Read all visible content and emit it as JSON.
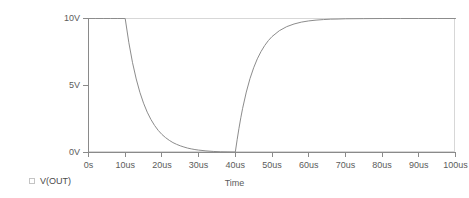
{
  "chart_data": {
    "type": "line",
    "title": "",
    "xlabel": "Time",
    "ylabel": "",
    "xlim": [
      0,
      100
    ],
    "xunit": "us",
    "ylim": [
      0,
      10
    ],
    "yunit": "V",
    "grid": false,
    "legend_position": "bottom-left",
    "x_ticks": [
      {
        "value": 0,
        "label": "0s"
      },
      {
        "value": 10,
        "label": "10us"
      },
      {
        "value": 20,
        "label": "20us"
      },
      {
        "value": 30,
        "label": "30us"
      },
      {
        "value": 40,
        "label": "40us"
      },
      {
        "value": 50,
        "label": "50us"
      },
      {
        "value": 60,
        "label": "60us"
      },
      {
        "value": 70,
        "label": "70us"
      },
      {
        "value": 80,
        "label": "80us"
      },
      {
        "value": 90,
        "label": "90us"
      },
      {
        "value": 100,
        "label": "100us"
      }
    ],
    "y_ticks": [
      {
        "value": 0,
        "label": "0V"
      },
      {
        "value": 5,
        "label": "5V"
      },
      {
        "value": 10,
        "label": "10V"
      }
    ],
    "series": [
      {
        "name": "V(OUT)",
        "color": "#8c8c8c",
        "x": [
          0,
          2,
          4,
          6,
          8,
          10,
          11,
          12,
          13,
          14,
          15,
          16,
          17,
          18,
          19,
          20,
          21,
          22,
          23,
          24,
          25,
          26,
          27,
          28,
          29,
          30,
          32,
          34,
          36,
          38,
          40,
          40.5,
          41,
          41.5,
          42,
          43,
          44,
          45,
          46,
          47,
          48,
          49,
          50,
          52,
          54,
          56,
          58,
          60,
          62,
          64,
          66,
          68,
          70,
          75,
          80,
          85,
          90,
          95,
          100
        ],
        "y": [
          10,
          10,
          10,
          10,
          10,
          10,
          8.19,
          6.7,
          5.49,
          4.49,
          3.68,
          3.01,
          2.47,
          2.02,
          1.65,
          1.35,
          1.11,
          0.91,
          0.74,
          0.61,
          0.5,
          0.41,
          0.33,
          0.27,
          0.22,
          0.18,
          0.12,
          0.08,
          0.05,
          0.04,
          0.03,
          0.95,
          1.81,
          2.59,
          3.3,
          4.51,
          5.51,
          6.32,
          6.99,
          7.53,
          7.98,
          8.35,
          8.65,
          9.09,
          9.39,
          9.59,
          9.73,
          9.82,
          9.88,
          9.92,
          9.95,
          9.96,
          9.98,
          9.99,
          10,
          10,
          10,
          10,
          10
        ]
      }
    ]
  },
  "legend": {
    "entries": [
      {
        "label": "V(OUT)",
        "swatch_color": "#8c8c8c"
      }
    ]
  },
  "axes": {
    "x_title": "Time"
  },
  "colors": {
    "trace": "#8c8c8c",
    "axis": "#8a8a8a",
    "frame": "#d7d7d7",
    "text": "#5b5b5b",
    "background": "#ffffff"
  }
}
